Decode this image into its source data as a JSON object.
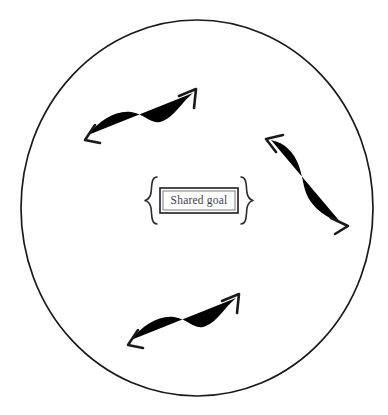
{
  "figure": {
    "type": "conceptual-diagram",
    "background_color": "#ffffff",
    "line_color": "#1a1a1a",
    "canvas": {
      "width": 388,
      "height": 415
    }
  },
  "boundary": {
    "shape_name": "outer-circle",
    "center_x": 197,
    "center_y": 208,
    "radius_x": 176,
    "radius_y": 188,
    "stroke_color": "#1a1a1a"
  },
  "center_node": {
    "label": "Shared goal",
    "text_color": "#3d3d48",
    "box": {
      "x": 160,
      "y": 188,
      "width": 78,
      "height": 25
    },
    "left_brace": "{",
    "right_brace": "}"
  },
  "arrows": [
    {
      "name": "arrow-top-left",
      "style": "double-headed-wavy",
      "orientation": "diagonal-up-right",
      "head_start": "down-left",
      "head_end": "up-right"
    },
    {
      "name": "arrow-right",
      "style": "double-headed-wavy",
      "orientation": "vertical-s-curve",
      "head_start": "up-left",
      "head_end": "down-right"
    },
    {
      "name": "arrow-bottom-left",
      "style": "double-headed-wavy",
      "orientation": "diagonal-up-right",
      "head_start": "down-left",
      "head_end": "up-right"
    }
  ],
  "caption": {
    "clipped_text": ""
  }
}
